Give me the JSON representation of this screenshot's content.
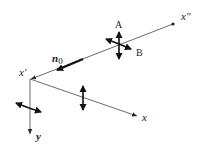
{
  "diagram": {
    "labels": {
      "x_double_prime": "x″",
      "x_prime": "x′",
      "x_axis": "x",
      "y_axis": "y",
      "n0_base": "n",
      "n0_sub": "0",
      "A": "A",
      "B": "B"
    },
    "colors": {
      "line": "#333333",
      "arrow": "#1a1a1a",
      "background": "#ffffff"
    }
  }
}
